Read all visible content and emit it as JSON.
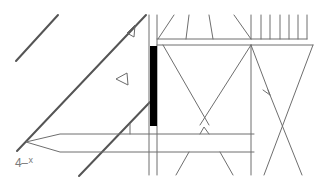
{
  "drawing": {
    "label_main": "4",
    "label_dash": "–",
    "label_sup": "x",
    "colors": {
      "line": "#6e6e6e",
      "heavy_line": "#555555",
      "fill_bar": "#000000",
      "background": "#ffffff"
    }
  }
}
